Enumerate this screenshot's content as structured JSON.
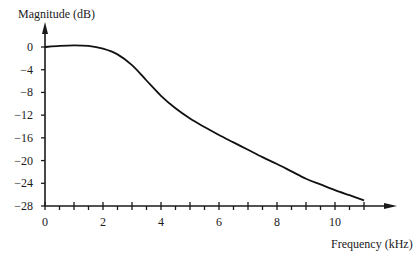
{
  "chart_data": {
    "type": "line",
    "title": "",
    "xlabel": "Frequency (kHz)",
    "ylabel": "Magnitude (dB)",
    "xlim": [
      0,
      11
    ],
    "ylim": [
      -28,
      0
    ],
    "x_ticks": [
      0,
      2,
      4,
      6,
      8,
      10
    ],
    "x_tick_labels": [
      "0",
      "2",
      "4",
      "6",
      "8",
      "10"
    ],
    "x_major_tick_step": 1,
    "x_minor_tick_step": 0.5,
    "y_ticks": [
      0,
      -4,
      -8,
      -12,
      -16,
      -20,
      -24,
      -28
    ],
    "y_tick_labels": [
      "0",
      "−4",
      "−8",
      "−12",
      "−16",
      "−20",
      "−24",
      "−28"
    ],
    "grid": false,
    "legend": "none",
    "series": [
      {
        "name": "Magnitude response",
        "x": [
          0,
          0.5,
          1,
          1.5,
          2,
          2.5,
          3,
          3.5,
          4,
          4.5,
          5,
          5.5,
          6,
          6.5,
          7,
          7.5,
          8,
          8.5,
          9,
          9.5,
          10,
          10.5,
          11
        ],
        "y": [
          0,
          0.2,
          0.3,
          0.2,
          -0.3,
          -1.3,
          -3.2,
          -5.9,
          -8.6,
          -10.8,
          -12.6,
          -14.1,
          -15.5,
          -16.8,
          -18.1,
          -19.4,
          -20.6,
          -21.9,
          -23.2,
          -24.2,
          -25.2,
          -26.1,
          -27.0
        ]
      }
    ]
  }
}
